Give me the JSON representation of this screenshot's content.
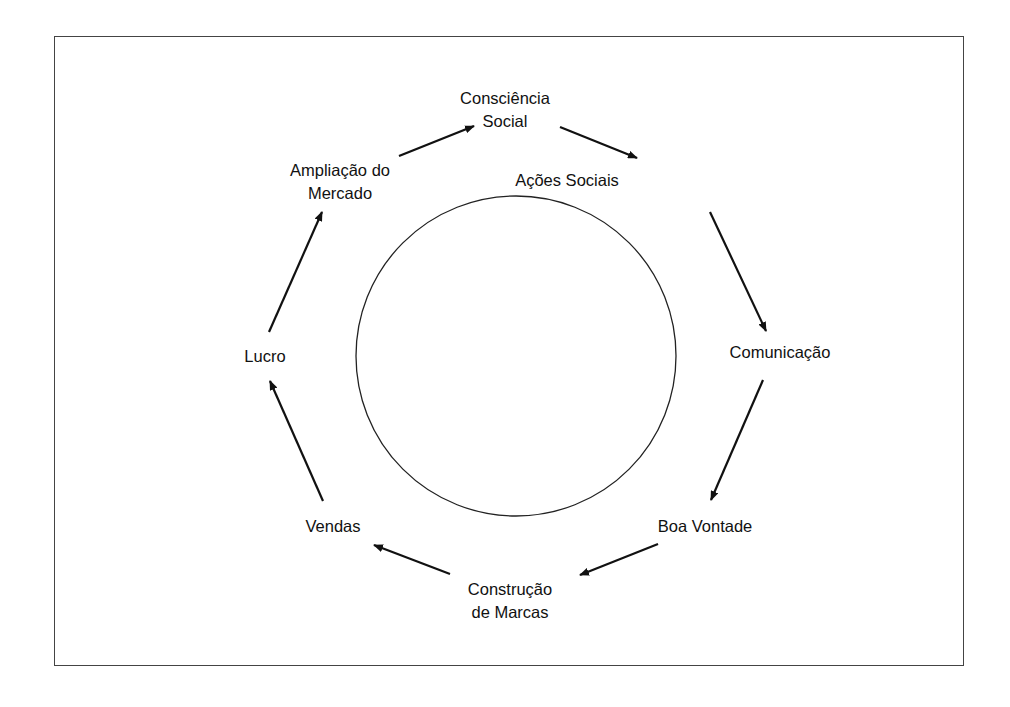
{
  "diagram": {
    "type": "cycle",
    "center_element": "circle",
    "nodes": [
      {
        "id": "consciencia",
        "lines": [
          "Consciência",
          "Social"
        ],
        "x": 505,
        "y": 110
      },
      {
        "id": "acoes",
        "lines": [
          "Ações Sociais"
        ],
        "x": 525,
        "y": 180
      },
      {
        "id": "comunicacao",
        "lines": [
          "Comunicação"
        ],
        "x": 780,
        "y": 352
      },
      {
        "id": "boa-vontade",
        "lines": [
          "Boa Vontade"
        ],
        "x": 705,
        "y": 526
      },
      {
        "id": "construcao",
        "lines": [
          "Construção",
          "de Marcas"
        ],
        "x": 510,
        "y": 601
      },
      {
        "id": "vendas",
        "lines": [
          "Vendas"
        ],
        "x": 333,
        "y": 526
      },
      {
        "id": "lucro",
        "lines": [
          "Lucro"
        ],
        "x": 265,
        "y": 356
      },
      {
        "id": "ampliacao",
        "lines": [
          "Ampliação do",
          "Mercado"
        ],
        "x": 340,
        "y": 182
      }
    ],
    "edges": [
      {
        "from": "ampliacao",
        "to": "consciencia"
      },
      {
        "from": "consciencia",
        "to": "acoes"
      },
      {
        "from": "acoes",
        "to": "comunicacao"
      },
      {
        "from": "comunicacao",
        "to": "boa-vontade"
      },
      {
        "from": "boa-vontade",
        "to": "construcao"
      },
      {
        "from": "construcao",
        "to": "vendas"
      },
      {
        "from": "vendas",
        "to": "lucro"
      },
      {
        "from": "lucro",
        "to": "ampliacao"
      }
    ]
  },
  "labels": {
    "consciencia_1": "Consciência",
    "consciencia_2": "Social",
    "acoes": "Ações Sociais",
    "comunicacao": "Comunicação",
    "boa_vontade": "Boa Vontade",
    "construcao_1": "Construção",
    "construcao_2": "de Marcas",
    "vendas": "Vendas",
    "lucro": "Lucro",
    "ampliacao_1": "Ampliação do",
    "ampliacao_2": "Mercado"
  },
  "colors": {
    "stroke": "#111111",
    "frame": "#444444",
    "background": "#ffffff"
  }
}
